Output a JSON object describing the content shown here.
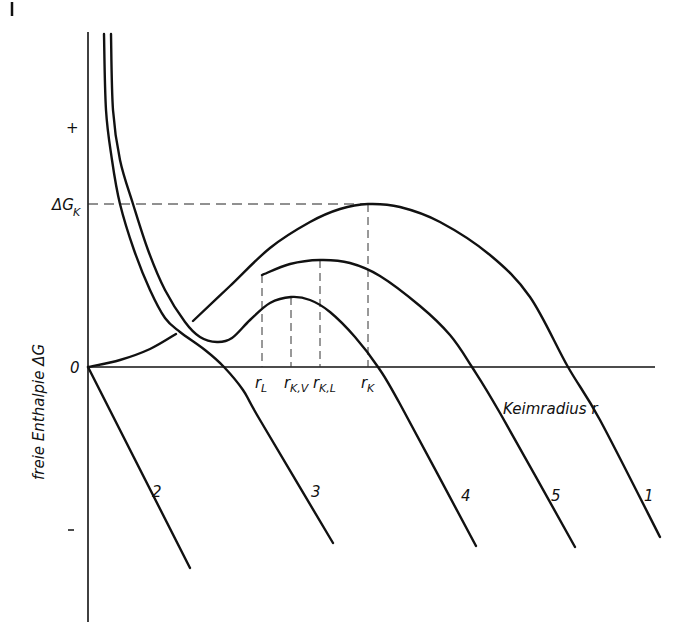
{
  "figure": {
    "y_axis_label": "freie Enthalpie ΔG",
    "x_axis_label": "Keimradius r",
    "y_tick_labels": {
      "plus": "+",
      "zero": "0",
      "minus": "–",
      "dGk_main": "ΔG",
      "dGk_sub": "K"
    },
    "r_markers": [
      {
        "main": "r",
        "sub": "L",
        "x": 262
      },
      {
        "main": "r",
        "sub": "K,V",
        "x": 291
      },
      {
        "main": "r",
        "sub": "K,L",
        "x": 320
      },
      {
        "main": "r",
        "sub": "K",
        "x": 368
      }
    ],
    "curve_labels": [
      {
        "text": "2",
        "x": 152,
        "y": 497
      },
      {
        "text": "3",
        "x": 311,
        "y": 497
      },
      {
        "text": "4",
        "x": 461,
        "y": 501
      },
      {
        "text": "5",
        "x": 551,
        "y": 501
      },
      {
        "text": "1",
        "x": 644,
        "y": 501
      }
    ]
  },
  "chart_data": {
    "type": "line",
    "title": "",
    "xlabel": "Keimradius r",
    "ylabel": "freie Enthalpie ΔG",
    "y_ticks": [
      "+",
      "ΔG_K",
      "0",
      "–"
    ],
    "x_markers": [
      "r_L",
      "r_K,V",
      "r_K,L",
      "r_K"
    ],
    "grid": false,
    "legend": "none (curves numbered 1–5 inline)",
    "pixel_frame": {
      "origin": [
        88,
        367
      ],
      "y_axis_top": 32,
      "y_axis_bottom": 622,
      "x_axis_right": 655
    },
    "reference_lines": [
      {
        "name": "ΔG_K level",
        "type": "horizontal-dashed",
        "y": 204,
        "x_from": 88,
        "x_to": 368
      },
      {
        "name": "r_L",
        "type": "vertical-dashed",
        "x": 262,
        "y_from": 275,
        "y_to": 367
      },
      {
        "name": "r_K,V",
        "type": "vertical-dashed",
        "x": 291,
        "y_from": 297,
        "y_to": 367
      },
      {
        "name": "r_K,L",
        "type": "vertical-dashed",
        "x": 320,
        "y_from": 260,
        "y_to": 367
      },
      {
        "name": "r_K",
        "type": "vertical-dashed",
        "x": 368,
        "y_from": 204,
        "y_to": 367
      }
    ],
    "series": [
      {
        "name": "1",
        "description": "homogeneous nucleation: rises from origin to maximum ΔG_K at r_K, then falls",
        "points": [
          [
            88,
            367
          ],
          [
            120,
            360
          ],
          [
            150,
            349
          ],
          [
            176,
            334
          ]
        ],
        "points_b": [
          [
            193,
            321
          ],
          [
            230,
            286
          ],
          [
            270,
            248
          ],
          [
            310,
            222
          ],
          [
            340,
            209
          ],
          [
            368,
            204
          ],
          [
            400,
            207
          ],
          [
            440,
            222
          ],
          [
            490,
            255
          ],
          [
            530,
            297
          ],
          [
            568,
            367
          ],
          [
            600,
            420
          ],
          [
            660,
            537
          ]
        ]
      },
      {
        "name": "2",
        "description": "straight falling line from origin",
        "points": [
          [
            88,
            367
          ],
          [
            190,
            568
          ]
        ]
      },
      {
        "name": "3",
        "description": "steep branch from top, crosses zero near x=224 and falls",
        "points": [
          [
            104,
            34
          ],
          [
            106,
            110
          ],
          [
            112,
            160
          ],
          [
            120,
            204
          ],
          [
            134,
            250
          ],
          [
            150,
            290
          ],
          [
            165,
            318
          ],
          [
            180,
            332
          ],
          [
            205,
            350
          ],
          [
            224,
            367
          ],
          [
            243,
            390
          ],
          [
            260,
            420
          ],
          [
            333,
            543
          ]
        ]
      },
      {
        "name": "4",
        "description": "steep branch from top, local minimum, maximum at r_K,V, then falls",
        "points": [
          [
            111,
            34
          ],
          [
            113,
            110
          ],
          [
            120,
            160
          ],
          [
            133,
            204
          ],
          [
            148,
            250
          ],
          [
            165,
            290
          ],
          [
            185,
            322
          ],
          [
            200,
            337
          ],
          [
            217,
            342
          ],
          [
            232,
            338
          ],
          [
            250,
            320
          ],
          [
            270,
            303
          ],
          [
            291,
            297
          ],
          [
            310,
            300
          ],
          [
            330,
            312
          ],
          [
            355,
            337
          ],
          [
            378,
            367
          ],
          [
            400,
            404
          ],
          [
            476,
            546
          ]
        ]
      },
      {
        "name": "5",
        "description": "starts at r_L, maximum at r_K,L, then falls",
        "points": [
          [
            262,
            275
          ],
          [
            290,
            264
          ],
          [
            320,
            260
          ],
          [
            350,
            263
          ],
          [
            380,
            276
          ],
          [
            420,
            306
          ],
          [
            450,
            335
          ],
          [
            472,
            367
          ],
          [
            500,
            413
          ],
          [
            575,
            547
          ]
        ]
      }
    ]
  }
}
